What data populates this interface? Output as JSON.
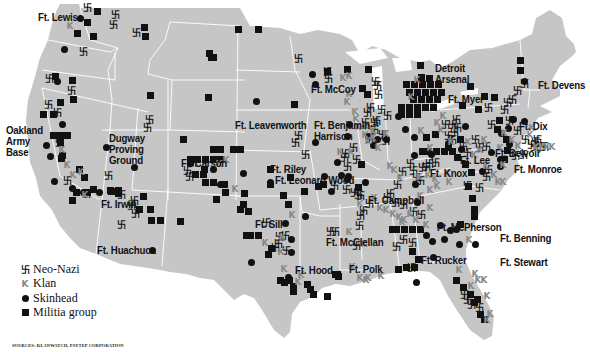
{
  "map": {
    "land_color": "#c6c6c6",
    "border_color": "#ffffff",
    "klan_color": "#888888",
    "marker_color": "#111111"
  },
  "legend": {
    "items": [
      {
        "symbol": "卐",
        "label": "Neo-Nazi"
      },
      {
        "symbol": "K",
        "label": "Klan"
      },
      {
        "symbol": "●",
        "label": "Skinhead"
      },
      {
        "symbol": "■",
        "label": "Militia group"
      }
    ]
  },
  "source": "SOURCES: KLANWATCH, PSYTEP CORPORATION",
  "bases": [
    {
      "name": "Ft. Lewis",
      "x": 38,
      "y": 12
    },
    {
      "name": "Oakland\nArmy\nBase",
      "x": 6,
      "y": 125
    },
    {
      "name": "Dugway\nProving\nGround",
      "x": 109,
      "y": 133
    },
    {
      "name": "Ft. Carson",
      "x": 181,
      "y": 158
    },
    {
      "name": "Ft. Irwin",
      "x": 101,
      "y": 199
    },
    {
      "name": "Ft. Huachuca",
      "x": 97,
      "y": 245
    },
    {
      "name": "Ft. Lewis",
      "x": 0,
      "y": 0
    },
    {
      "name": "Ft. McCoy",
      "x": 311,
      "y": 84
    },
    {
      "name": "Ft. Leavenworth",
      "x": 235,
      "y": 120
    },
    {
      "name": "Ft. Benjamin\nHarrison",
      "x": 314,
      "y": 120
    },
    {
      "name": "Ft. Riley",
      "x": 270,
      "y": 164
    },
    {
      "name": "Ft. Leonard Wood",
      "x": 275,
      "y": 175
    },
    {
      "name": "Ft. Sill",
      "x": 255,
      "y": 219
    },
    {
      "name": "Ft. Hood",
      "x": 295,
      "y": 265
    },
    {
      "name": "Ft. Polk",
      "x": 349,
      "y": 264
    },
    {
      "name": "Ft. Campbell",
      "x": 368,
      "y": 195
    },
    {
      "name": "Ft. McClellan",
      "x": 326,
      "y": 237
    },
    {
      "name": "Detroit\nArsenal",
      "x": 435,
      "y": 63
    },
    {
      "name": "Ft. Myer",
      "x": 448,
      "y": 94
    },
    {
      "name": "Ft. Devens",
      "x": 538,
      "y": 80
    },
    {
      "name": "Ft. Dix",
      "x": 519,
      "y": 121
    },
    {
      "name": "Ft. Belvoir",
      "x": 495,
      "y": 148
    },
    {
      "name": "Ft. Lee",
      "x": 460,
      "y": 155
    },
    {
      "name": "Ft. Monroe",
      "x": 514,
      "y": 164
    },
    {
      "name": "Ft. Knox",
      "x": 430,
      "y": 168
    },
    {
      "name": "Ft. McPherson",
      "x": 437,
      "y": 222
    },
    {
      "name": "Ft. Benning",
      "x": 500,
      "y": 233
    },
    {
      "name": "Ft. Rucker",
      "x": 421,
      "y": 255
    },
    {
      "name": "Ft. Stewart",
      "x": 500,
      "y": 257
    }
  ]
}
